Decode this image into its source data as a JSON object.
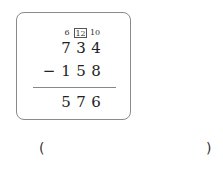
{
  "problem": {
    "type": "vertical-subtraction",
    "borrow_marks": [
      "6",
      "12",
      "10"
    ],
    "borrow_boxed_index": 1,
    "minuend": [
      "7",
      "3",
      "4"
    ],
    "operator": "−",
    "subtrahend": [
      "1",
      "5",
      "8"
    ],
    "result": [
      "5",
      "7",
      "6"
    ]
  },
  "answer": {
    "open_paren": "(",
    "close_paren": ")",
    "value": "",
    "placeholder": ""
  },
  "colors": {
    "card_border": "#8a8a8a",
    "text": "#222222",
    "background": "#ffffff"
  }
}
